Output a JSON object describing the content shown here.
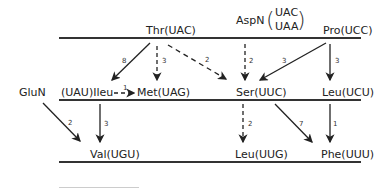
{
  "diagram": {
    "nodes": {
      "thr": "Thr(UAC)",
      "aspn": "AspN",
      "aspn_codon_1": "UAC",
      "aspn_codon_2": "UAA",
      "pro": "Pro(UCC)",
      "glun": "GluN",
      "ileu": "(UAU)Ileu",
      "met": "Met(UAG)",
      "ser": "Ser(UUC)",
      "leu_ucu": "Leu(UCU)",
      "val": "Val(UGU)",
      "leu_uug": "Leu(UUG)",
      "phe": "Phe(UUU)"
    },
    "edges": [
      {
        "from": "Thr(UAC)",
        "to": "(UAU)Ileu",
        "weight": "8",
        "style": "solid"
      },
      {
        "from": "Thr(UAC)",
        "to": "Met(UAG)",
        "weight": "3",
        "style": "dashed"
      },
      {
        "from": "Thr(UAC)",
        "to": "Ser(UUC)",
        "weight": "2",
        "style": "dashed"
      },
      {
        "from": "AspN",
        "to": "Ser(UUC)",
        "weight": "2",
        "style": "dashed"
      },
      {
        "from": "Pro(UCC)",
        "to": "Ser(UUC)",
        "weight": "3",
        "style": "solid"
      },
      {
        "from": "Pro(UCC)",
        "to": "Leu(UCU)",
        "weight": "3",
        "style": "solid"
      },
      {
        "from": "(UAU)Ileu",
        "to": "Met(UAG)",
        "weight": "1",
        "style": "dashed"
      },
      {
        "from": "GluN",
        "to": "Val(UGU)",
        "weight": "2",
        "style": "solid"
      },
      {
        "from": "(UAU)Ileu",
        "to": "Val(UGU)",
        "weight": "3",
        "style": "solid"
      },
      {
        "from": "Ser(UUC)",
        "to": "Leu(UUG)",
        "weight": "2",
        "style": "dashed"
      },
      {
        "from": "Ser(UUC)",
        "to": "Phe(UUU)",
        "weight": "7",
        "style": "solid"
      },
      {
        "from": "Leu(UCU)",
        "to": "Phe(UUU)",
        "weight": "1",
        "style": "solid"
      }
    ]
  }
}
